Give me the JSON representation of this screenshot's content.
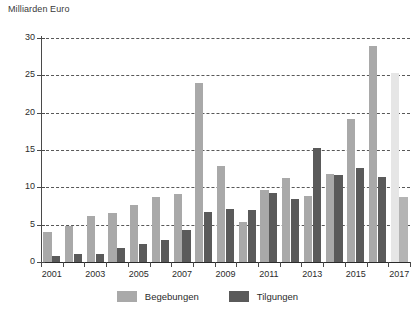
{
  "chart_data": {
    "type": "bar",
    "title": "",
    "ylabel": "Milliarden Euro",
    "xlabel": "",
    "ylim": [
      0,
      30
    ],
    "yticks": [
      0,
      5,
      10,
      15,
      20,
      25,
      30
    ],
    "grid": true,
    "legend_position": "bottom",
    "categories": [
      "2001",
      "2002",
      "2003",
      "2004",
      "2005",
      "2006",
      "2007",
      "2008",
      "2009",
      "2010",
      "2011",
      "2012",
      "2013",
      "2014",
      "2015",
      "2016",
      "2017"
    ],
    "xtick_labels": [
      "2001",
      "2003",
      "2005",
      "2007",
      "2009",
      "2011",
      "2013",
      "2015",
      "2017"
    ],
    "series": [
      {
        "name": "Begebungen",
        "color": "#a9a9a9",
        "values": [
          4.0,
          4.8,
          6.1,
          6.6,
          7.7,
          8.7,
          9.1,
          24.0,
          12.8,
          5.3,
          9.7,
          11.2,
          8.9,
          11.8,
          19.1,
          28.9,
          25.3
        ]
      },
      {
        "name": "Tilgungen",
        "color": "#5a5a5a",
        "values": [
          0.8,
          1.1,
          1.1,
          1.9,
          2.4,
          3.0,
          4.3,
          6.7,
          7.1,
          6.9,
          9.3,
          8.5,
          15.3,
          11.6,
          12.6,
          11.4,
          8.7
        ]
      }
    ],
    "projected_categories": [
      "2017"
    ],
    "projection_colors": {
      "begebungen": "#e6e6e6",
      "tilgungen": "#b4b4b4"
    }
  },
  "legend": {
    "items": [
      {
        "label": "Begebungen",
        "color": "#a9a9a9"
      },
      {
        "label": "Tilgungen",
        "color": "#5a5a5a"
      }
    ]
  }
}
